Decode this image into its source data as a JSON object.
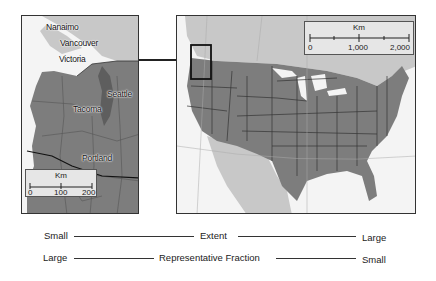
{
  "left_map": {
    "cities": [
      {
        "name": "Nanaimo"
      },
      {
        "name": "Vancouver"
      },
      {
        "name": "Victoria"
      },
      {
        "name": "Seattle"
      },
      {
        "name": "Tacoma"
      },
      {
        "name": "Portland"
      }
    ],
    "scale_bar": {
      "unit": "Km",
      "ticks": [
        "0",
        "100",
        "200"
      ]
    }
  },
  "right_map": {
    "scale_bar": {
      "unit": "Km",
      "ticks": [
        "0",
        "1,000",
        "2,000"
      ]
    }
  },
  "axes": {
    "extent": {
      "left": "Small",
      "label": "Extent",
      "right": "Large"
    },
    "representative_fraction": {
      "left": "Large",
      "label": "Representative Fraction",
      "right": "Small"
    }
  },
  "colors": {
    "land_focus": "#7d7d7d",
    "land_other": "#c8c8c8",
    "water": "#f4f4f4",
    "borders": "#333333"
  }
}
